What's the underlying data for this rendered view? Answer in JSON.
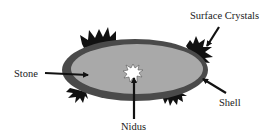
{
  "diagram": {
    "labels": {
      "surface_crystals": "Surface Crystals",
      "stone": "Stone",
      "shell": "Shell",
      "nidus": "Nidus"
    },
    "colors": {
      "shell": "#4a4a4a",
      "stone": "#a9a9a9",
      "nidus": "#ffffff",
      "crystals": "#111111",
      "arrow": "#111111",
      "text": "#1a1a1a"
    }
  }
}
